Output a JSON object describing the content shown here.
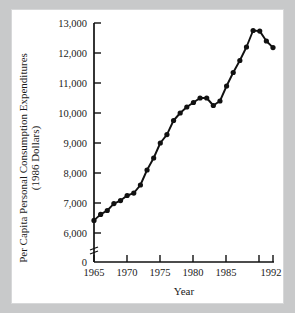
{
  "chart_data": {
    "type": "line",
    "title": "",
    "xlabel": "Year",
    "ylabel": "Per Capita Personal Consumption Expenditures (1986 Dollars)",
    "ylabel_line1": "Per Capita Personal Consumption Expenditures",
    "ylabel_line2": "(1986 Dollars)",
    "xlim": [
      1965,
      1992
    ],
    "ylim": [
      6000,
      13000
    ],
    "y_axis_broken": true,
    "y_break_label": "0",
    "grid": false,
    "legend": null,
    "y_ticks": [
      6000,
      7000,
      8000,
      9000,
      10000,
      11000,
      12000,
      13000
    ],
    "y_tick_labels": [
      "6,000",
      "7,000",
      "8,000",
      "9,000",
      "10,000",
      "11,000",
      "12,000",
      "13,000"
    ],
    "x_ticks": [
      1965,
      1970,
      1975,
      1980,
      1985,
      1990,
      1992
    ],
    "x_tick_labels": [
      "1965",
      "1970",
      "1975",
      "1980",
      "1985",
      "",
      "1992"
    ],
    "x": [
      1965,
      1966,
      1967,
      1968,
      1969,
      1970,
      1971,
      1972,
      1973,
      1974,
      1975,
      1976,
      1977,
      1978,
      1979,
      1980,
      1981,
      1982,
      1983,
      1984,
      1985,
      1986,
      1987,
      1988,
      1989,
      1990,
      1991,
      1992
    ],
    "values": [
      6420,
      6620,
      6750,
      6980,
      7080,
      7250,
      7330,
      7600,
      8100,
      8500,
      9000,
      9280,
      9750,
      10000,
      10200,
      10350,
      10500,
      10500,
      10250,
      10400,
      10900,
      11350,
      11750,
      12200,
      12750,
      12730,
      12400,
      12180
    ],
    "series": [
      {
        "name": "Per Capita Personal Consumption Expenditures",
        "values": [
          6420,
          6620,
          6750,
          6980,
          7080,
          7250,
          7330,
          7600,
          8100,
          8500,
          9000,
          9280,
          9750,
          10000,
          10200,
          10350,
          10500,
          10500,
          10250,
          10400,
          10900,
          11350,
          11750,
          12200,
          12750,
          12730,
          12400,
          12180
        ]
      }
    ],
    "marker": "filled-circle",
    "line_color": "#111111"
  }
}
